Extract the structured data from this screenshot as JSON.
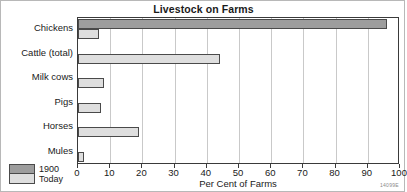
{
  "figure": {
    "title": "Livestock on Farms",
    "corner_code": "14099E",
    "colors": {
      "series_1900": "#9d9d9d",
      "series_today": "#dedede",
      "bar_outline": "#4a4a4a",
      "gridline": "#c9c9c9",
      "frame": "#b8b8b8",
      "axis": "#3a3a3a",
      "background": "#ffffff"
    }
  },
  "legend": {
    "position": "bottom-left",
    "entries": [
      {
        "label": "1900",
        "color": "#9d9d9d"
      },
      {
        "label": "Today",
        "color": "#dedede"
      }
    ]
  },
  "chart_data": {
    "type": "bar",
    "orientation": "horizontal",
    "title": "Livestock on Farms",
    "subtitle": "",
    "xlabel": "Per Cent of Farms",
    "ylabel": "",
    "categories": [
      "Chickens",
      "Cattle (total)",
      "Milk cows",
      "Pigs",
      "Horses",
      "Mules"
    ],
    "series": [
      {
        "name": "1900",
        "color": "#9d9d9d",
        "values": [
          96,
          0,
          0,
          0,
          0,
          0
        ]
      },
      {
        "name": "Today",
        "color": "#dedede",
        "values": [
          6.5,
          44,
          8,
          7,
          19,
          2
        ]
      }
    ],
    "xlim": [
      0,
      100
    ],
    "xticks": [
      0,
      10,
      20,
      30,
      40,
      50,
      60,
      70,
      80,
      90,
      100
    ],
    "xticklabels": [
      "0",
      "10",
      "20",
      "30",
      "40",
      "50",
      "60",
      "70",
      "80",
      "90",
      "100"
    ],
    "grid": "vertical",
    "legend_position": "bottom-left",
    "annotations": []
  }
}
